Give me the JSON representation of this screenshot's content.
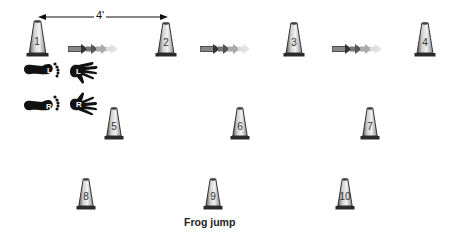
{
  "figure": {
    "caption": "Frog jump",
    "dimension": {
      "label": "4'",
      "from_cone": 1,
      "to_cone": 2
    },
    "cones": [
      {
        "number": "1",
        "row": 1,
        "x": 37,
        "y": 20,
        "h": 37
      },
      {
        "number": "2",
        "row": 1,
        "x": 166,
        "y": 22,
        "h": 35
      },
      {
        "number": "3",
        "row": 1,
        "x": 294,
        "y": 22,
        "h": 35
      },
      {
        "number": "4",
        "row": 1,
        "x": 425,
        "y": 22,
        "h": 35
      },
      {
        "number": "5",
        "row": 2,
        "x": 114,
        "y": 107,
        "h": 33
      },
      {
        "number": "6",
        "row": 2,
        "x": 240,
        "y": 107,
        "h": 33
      },
      {
        "number": "7",
        "row": 2,
        "x": 370,
        "y": 107,
        "h": 33
      },
      {
        "number": "8",
        "row": 3,
        "x": 86,
        "y": 178,
        "h": 32
      },
      {
        "number": "9",
        "row": 3,
        "x": 213,
        "y": 178,
        "h": 32
      },
      {
        "number": "10",
        "row": 3,
        "x": 345,
        "y": 178,
        "h": 32
      }
    ],
    "arrows": [
      {
        "label": "direction-arrow-1-2",
        "x": 68,
        "y": 47
      },
      {
        "label": "direction-arrow-2-3",
        "x": 200,
        "y": 47
      },
      {
        "label": "direction-arrow-3-4",
        "x": 332,
        "y": 47
      }
    ],
    "legend": {
      "left_foot_label": "L",
      "left_hand_label": "L",
      "right_foot_label": "R",
      "right_hand_label": "R"
    }
  }
}
